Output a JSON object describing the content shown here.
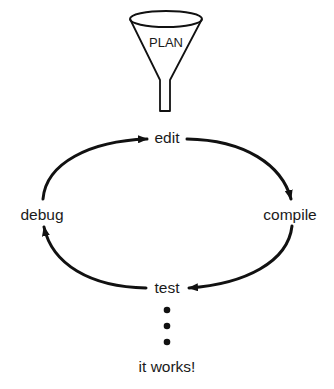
{
  "diagram": {
    "type": "process-cycle",
    "funnel": {
      "label": "PLAN",
      "icon": "funnel-icon"
    },
    "nodes": [
      {
        "id": "edit",
        "label": "edit"
      },
      {
        "id": "compile",
        "label": "compile"
      },
      {
        "id": "test",
        "label": "test"
      },
      {
        "id": "debug",
        "label": "debug"
      }
    ],
    "edges": [
      {
        "from": "PLAN",
        "to": "edit"
      },
      {
        "from": "edit",
        "to": "compile"
      },
      {
        "from": "compile",
        "to": "test"
      },
      {
        "from": "test",
        "to": "debug"
      },
      {
        "from": "debug",
        "to": "edit"
      }
    ],
    "continuation": {
      "icon": "vertical-ellipsis-icon",
      "label": "it works!"
    },
    "colors": {
      "stroke": "#111111",
      "text": "#1a1a1a",
      "background": "#ffffff"
    }
  }
}
